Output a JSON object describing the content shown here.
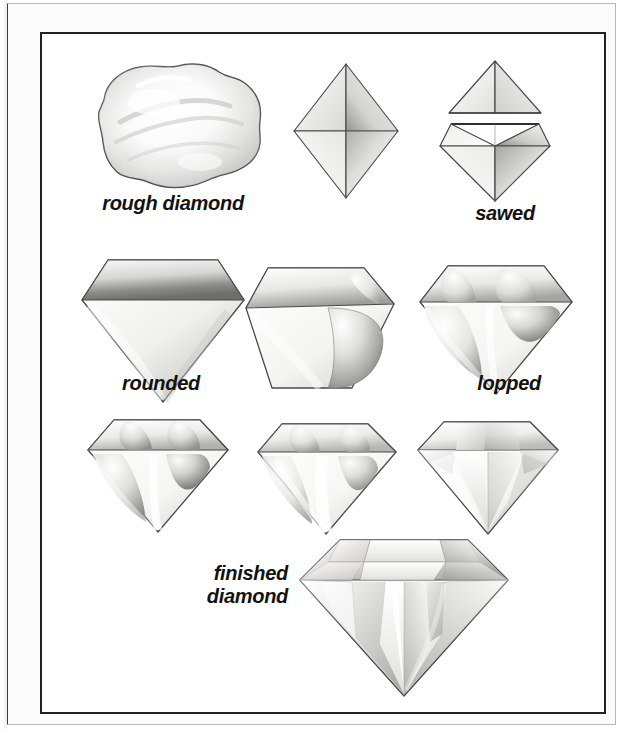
{
  "figure": {
    "background_color": "#ffffff",
    "frame_color": "#222222",
    "mat_color": "#fbfbfb",
    "label_color": "#111111"
  },
  "labels": {
    "rough": "rough diamond",
    "sawed": "sawed",
    "rounded": "rounded",
    "lopped": "lopped",
    "finished": "finished\ndiamond"
  },
  "stages": [
    {
      "id": "rough",
      "name": "rough-diamond",
      "row": 1,
      "col": 1,
      "labeled": true,
      "label": "rough diamond"
    },
    {
      "id": "cleaved",
      "name": "cleaved-octahedron",
      "row": 1,
      "col": 2,
      "labeled": false,
      "label": ""
    },
    {
      "id": "sawed",
      "name": "sawed-diamond",
      "row": 1,
      "col": 3,
      "labeled": true,
      "label": "sawed"
    },
    {
      "id": "rounded",
      "name": "rounded-diamond",
      "row": 2,
      "col": 1,
      "labeled": true,
      "label": "rounded"
    },
    {
      "id": "girdled",
      "name": "girdled-diamond",
      "row": 2,
      "col": 2,
      "labeled": false,
      "label": ""
    },
    {
      "id": "lopped",
      "name": "lopped-diamond",
      "row": 2,
      "col": 3,
      "labeled": true,
      "label": "lopped"
    },
    {
      "id": "brillian-a",
      "name": "brillianteered-step-1",
      "row": 3,
      "col": 1,
      "labeled": false,
      "label": ""
    },
    {
      "id": "brillian-b",
      "name": "brillianteered-step-2",
      "row": 3,
      "col": 2,
      "labeled": false,
      "label": ""
    },
    {
      "id": "brillian-c",
      "name": "brillianteered-step-3",
      "row": 3,
      "col": 3,
      "labeled": false,
      "label": ""
    },
    {
      "id": "finished",
      "name": "finished-diamond",
      "row": 4,
      "col": 2,
      "labeled": true,
      "label": "finished diamond"
    }
  ]
}
